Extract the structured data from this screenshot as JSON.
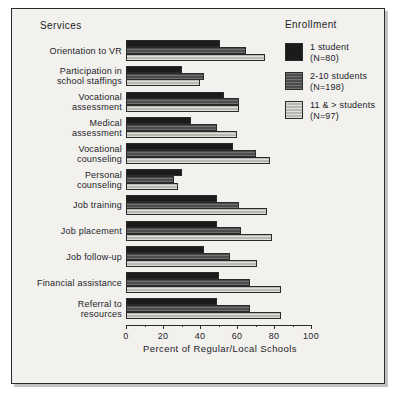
{
  "figure": {
    "services_heading": "Services",
    "enrollment_heading": "Enrollment"
  },
  "legend": {
    "position": "top-right",
    "entries": [
      {
        "label": "1 student",
        "sublabel": "(N=80)",
        "swatch": "dark-solid-swatch",
        "color": "#1b1b1b"
      },
      {
        "label": "2-10 students",
        "sublabel": "(N=198)",
        "swatch": "medium-hatched-swatch",
        "color": "#4d4d4d"
      },
      {
        "label": "11 & > students",
        "sublabel": "(N=97)",
        "swatch": "light-hatched-swatch",
        "color": "#b9b7b2"
      }
    ]
  },
  "axis": {
    "xlabel": "Percent of Regular/Local Schools",
    "ticks": [
      "0",
      "20",
      "40",
      "60",
      "80",
      "100"
    ]
  },
  "chart_data": {
    "type": "bar",
    "orientation": "horizontal",
    "title": "",
    "subtitle": "",
    "xlabel": "Percent of Regular/Local Schools",
    "ylabel": "Services",
    "xlim": [
      0,
      100
    ],
    "xticks": [
      0,
      20,
      40,
      60,
      80,
      100
    ],
    "minor_ticks": [
      10,
      30,
      50,
      70,
      90
    ],
    "grid": false,
    "legend_title": "Enrollment",
    "legend_position": "top-right",
    "categories": [
      "Orientation to VR",
      "Participation in school staffings",
      "Vocational assessment",
      "Medical assessment",
      "Vocational counseling",
      "Personal counseling",
      "Job training",
      "Job placement",
      "Job follow-up",
      "Financial assistance",
      "Referral to resources"
    ],
    "category_lines": [
      [
        "Orientation to VR"
      ],
      [
        "Participation in",
        "school staffings"
      ],
      [
        "Vocational",
        "assessment"
      ],
      [
        "Medical",
        "assessment"
      ],
      [
        "Vocational",
        "counseling"
      ],
      [
        "Personal",
        "counseling"
      ],
      [
        "Job training"
      ],
      [
        "Job placement"
      ],
      [
        "Job follow-up"
      ],
      [
        "Financial assistance"
      ],
      [
        "Referral to",
        "resources"
      ]
    ],
    "series": [
      {
        "name": "1 student (N=80)",
        "color": "#1b1b1b",
        "values": [
          51,
          30,
          53,
          35,
          58,
          30,
          49,
          49,
          42,
          50,
          49
        ]
      },
      {
        "name": "2-10 students (N=198)",
        "color": "#4d4d4d",
        "values": [
          65,
          42,
          61,
          49,
          70,
          26,
          61,
          62,
          56,
          67,
          67
        ]
      },
      {
        "name": "11 & > students (N=97)",
        "color": "#b9b7b2",
        "values": [
          75,
          40,
          61,
          60,
          78,
          28,
          76,
          79,
          71,
          84,
          84
        ]
      }
    ]
  }
}
